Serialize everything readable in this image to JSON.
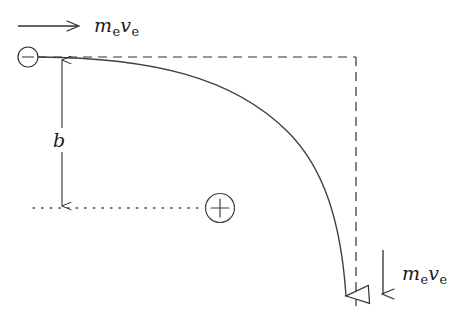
{
  "figure": {
    "background_color": "#ffffff",
    "stroke_color": "#303030",
    "text_color": "#1a1a1a",
    "width": 473,
    "height": 331
  },
  "labels": {
    "momentum_top": {
      "symbol": "m",
      "sub1": "e",
      "symbol2": "v",
      "sub2": "e",
      "plain": "m_e v_e"
    },
    "momentum_bottom": {
      "symbol": "m",
      "sub1": "e",
      "symbol2": "v",
      "sub2": "e",
      "plain": "m_e v_e"
    },
    "impact_parameter": {
      "symbol": "b",
      "plain": "b"
    }
  },
  "charges": {
    "electron": {
      "sign": "−",
      "name": "negative-charge",
      "cx": 28,
      "cy": 57,
      "r": 10
    },
    "nucleus": {
      "sign": "+",
      "name": "positive-charge",
      "cx": 220,
      "cy": 208,
      "r": 15
    }
  },
  "elements": {
    "incoming_arrow": "horizontal arrow pointing right, indicating initial momentum direction",
    "outgoing_arrow": "vertical arrow pointing down, indicating final momentum direction",
    "trajectory": "solid curved path of deflected electron",
    "asymptote_horizontal": "dashed horizontal asymptote",
    "asymptote_vertical": "dashed vertical asymptote",
    "axis_through_nucleus": "dotted horizontal line through positive charge",
    "impact_parameter_arrow": "double headed vertical arrow labelled b"
  }
}
